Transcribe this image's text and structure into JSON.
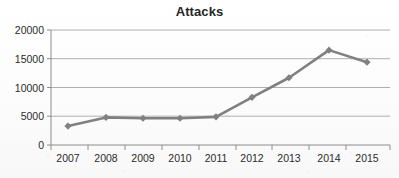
{
  "chart_data": {
    "type": "line",
    "title": "Attacks",
    "xlabel": "",
    "ylabel": "",
    "categories": [
      "2007",
      "2008",
      "2009",
      "2010",
      "2011",
      "2012",
      "2013",
      "2014",
      "2015"
    ],
    "values": [
      3300,
      4800,
      4650,
      4650,
      4900,
      8300,
      11700,
      16500,
      14400
    ],
    "series": [
      {
        "name": "Attacks",
        "values": [
          3300,
          4800,
          4650,
          4650,
          4900,
          8300,
          11700,
          16500,
          14400
        ]
      }
    ],
    "ylim": [
      0,
      20000
    ],
    "ytick_labels": [
      "0",
      "5000",
      "10000",
      "15000",
      "20000"
    ],
    "ytick_values": [
      0,
      5000,
      10000,
      15000,
      20000
    ],
    "grid": "horizontal",
    "legend": "none",
    "marker": "diamond",
    "series_color": "#808080",
    "gridline_color": "#a6a6a6",
    "axis_color": "#8c8c8c",
    "title_color": "#262626",
    "tick_label_color": "#2b2b2b"
  },
  "chart": {
    "title": "Attacks"
  }
}
